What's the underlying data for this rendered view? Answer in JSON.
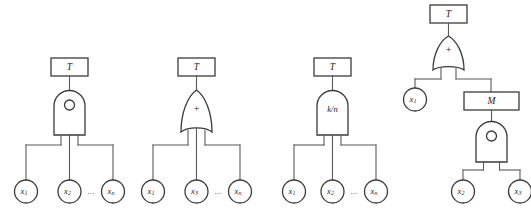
{
  "figure": {
    "background_color": "#ffffff",
    "line_color": "#4a4a4a",
    "shape_fill": "#ffffff",
    "text_color": "#1c1c1c",
    "ellipsis": "...",
    "trees": [
      {
        "id": "tree-1",
        "name": "series-system-fault-tree",
        "top_event_label": "T",
        "gate": {
          "name": "or-gate-circle",
          "shape": "arch",
          "symbol": "circle",
          "label": ""
        },
        "leaves": [
          {
            "label": "x",
            "sub": "1"
          },
          {
            "label": "x",
            "sub": "2"
          },
          {
            "label": "x",
            "sub": "n"
          }
        ],
        "has_ellipsis": true
      },
      {
        "id": "tree-2",
        "name": "parallel-system-fault-tree",
        "top_event_label": "T",
        "gate": {
          "name": "or-gate-plus",
          "shape": "or",
          "symbol": "plus",
          "label": "+"
        },
        "leaves": [
          {
            "label": "x",
            "sub": "1"
          },
          {
            "label": "x",
            "sub": "3"
          },
          {
            "label": "x",
            "sub": "n"
          }
        ],
        "has_ellipsis": true
      },
      {
        "id": "tree-3",
        "name": "k-out-of-n-system-fault-tree",
        "top_event_label": "T",
        "gate": {
          "name": "voting-gate",
          "shape": "arch",
          "symbol": "text",
          "label": "k/n"
        },
        "leaves": [
          {
            "label": "x",
            "sub": "1"
          },
          {
            "label": "x",
            "sub": "2"
          },
          {
            "label": "x",
            "sub": "n"
          }
        ],
        "has_ellipsis": true
      },
      {
        "id": "tree-4",
        "name": "nested-module-fault-tree",
        "top_event_label": "T",
        "gate": {
          "name": "or-gate-plus",
          "shape": "or",
          "symbol": "plus",
          "label": "+"
        },
        "intermediate_event_label": "M",
        "sub_gate": {
          "name": "or-gate-circle",
          "shape": "arch",
          "symbol": "circle",
          "label": ""
        },
        "leaves": [
          {
            "label": "x",
            "sub": "1"
          },
          {
            "label": "x",
            "sub": "2"
          },
          {
            "label": "x",
            "sub": "3"
          }
        ],
        "has_ellipsis": false
      }
    ]
  }
}
